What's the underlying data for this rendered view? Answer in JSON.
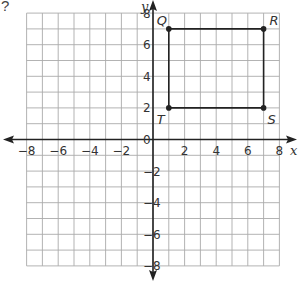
{
  "question_mark": "?",
  "chart_data": {
    "type": "scatter",
    "title": "",
    "xlabel": "x",
    "ylabel": "y",
    "xlim": [
      -8,
      8
    ],
    "ylim": [
      -8,
      8
    ],
    "grid": true,
    "grid_step": 1,
    "x_ticks": [
      -8,
      -6,
      -4,
      -2,
      2,
      4,
      6,
      8
    ],
    "y_ticks": [
      -8,
      -6,
      -4,
      -2,
      0,
      2,
      4,
      6,
      8
    ],
    "x_tick_labels": [
      "−8",
      "−6",
      "−4",
      "−2",
      "2",
      "4",
      "6",
      "8"
    ],
    "y_tick_labels": [
      "−8",
      "−6",
      "−4",
      "−2",
      "0",
      "2",
      "4",
      "6",
      "8"
    ],
    "points": [
      {
        "label": "Q",
        "x": 1,
        "y": 7
      },
      {
        "label": "R",
        "x": 7,
        "y": 7
      },
      {
        "label": "S",
        "x": 7,
        "y": 2
      },
      {
        "label": "T",
        "x": 1,
        "y": 2
      }
    ],
    "polygon": [
      "Q",
      "R",
      "S",
      "T"
    ],
    "colors": {
      "grid": "#aaaaaa",
      "axis": "#222222",
      "shape": "#222222"
    }
  }
}
